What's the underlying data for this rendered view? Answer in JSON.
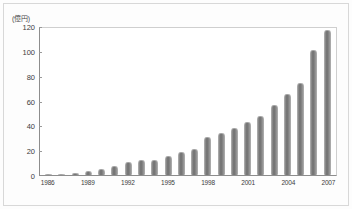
{
  "chart_data": {
    "type": "bar",
    "title": "",
    "subtitle": "",
    "unit_label": "(億円)",
    "xlabel": "",
    "ylabel": "",
    "ylim": [
      0,
      120
    ],
    "yticks": [
      0,
      20,
      40,
      60,
      80,
      100,
      120
    ],
    "grid": false,
    "legend": null,
    "bar_color": "#7a7a7a",
    "axis_color": "#8d8d8d",
    "categories": [
      "1986",
      "1987",
      "1988",
      "1989",
      "1990",
      "1991",
      "1992",
      "1993",
      "1994",
      "1995",
      "1996",
      "1997",
      "1998",
      "1999",
      "2000",
      "2001",
      "2002",
      "2003",
      "2004",
      "2005",
      "2006",
      "2007"
    ],
    "xtick_labels": [
      "1986",
      "1989",
      "1992",
      "1995",
      "1998",
      "2001",
      "2004",
      "2007"
    ],
    "values": [
      0.5,
      1.2,
      2.0,
      3.0,
      5.0,
      7.5,
      11.0,
      12.0,
      12.5,
      15.5,
      19.0,
      21.0,
      31.0,
      34.0,
      38.5,
      43.0,
      48.0,
      57.0,
      66.0,
      75.0,
      102.0,
      118.0
    ]
  }
}
